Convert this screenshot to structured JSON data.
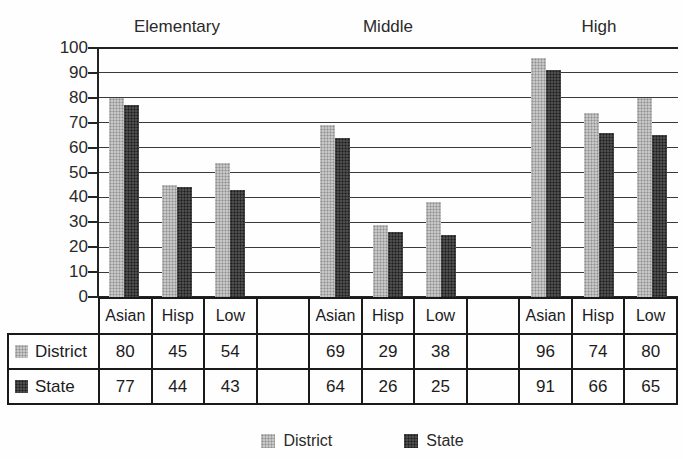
{
  "chart_data": {
    "type": "bar",
    "groups": [
      "Elementary",
      "Middle",
      "High"
    ],
    "categories": [
      "Asian",
      "Hisp",
      "Low"
    ],
    "series": [
      {
        "name": "District",
        "values": [
          [
            80,
            45,
            54
          ],
          [
            69,
            29,
            38
          ],
          [
            96,
            74,
            80
          ]
        ]
      },
      {
        "name": "State",
        "values": [
          [
            77,
            44,
            43
          ],
          [
            64,
            26,
            25
          ],
          [
            91,
            66,
            65
          ]
        ]
      }
    ],
    "ylim": [
      0,
      100
    ],
    "yticks": [
      0,
      10,
      20,
      30,
      40,
      50,
      60,
      70,
      80,
      90,
      100
    ],
    "grid": true,
    "legend_position": "bottom"
  },
  "table": {
    "column_headers": [
      "Asian",
      "Hisp",
      "Low",
      "",
      "Asian",
      "Hisp",
      "Low",
      "",
      "Asian",
      "Hisp",
      "Low"
    ],
    "rows": [
      {
        "label": "District",
        "values": [
          "80",
          "45",
          "54",
          "",
          "69",
          "29",
          "38",
          "",
          "96",
          "74",
          "80"
        ]
      },
      {
        "label": "State",
        "values": [
          "77",
          "44",
          "43",
          "",
          "64",
          "26",
          "25",
          "",
          "91",
          "66",
          "65"
        ]
      }
    ]
  },
  "legend": {
    "items": [
      {
        "label": "District",
        "color": "#b5b5b5"
      },
      {
        "label": "State",
        "color": "#3e3e3e"
      }
    ]
  },
  "colors": {
    "district_bar": "#b5b5b5",
    "state_bar": "#3e3e3e",
    "axis": "#232323",
    "background": "#fefefe"
  }
}
